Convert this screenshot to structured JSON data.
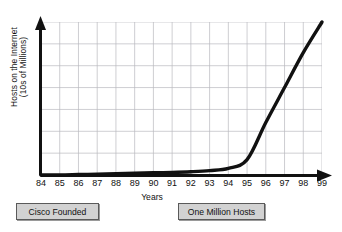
{
  "chart_data": {
    "type": "line",
    "title": "",
    "xlabel": "Years",
    "ylabel_lines": [
      "Hosts on the Internet",
      "(10s of Millions)"
    ],
    "ylabel": "Hosts on the Internet (10s of Millions)",
    "categories": [
      "84",
      "85",
      "86",
      "87",
      "88",
      "89",
      "90",
      "91",
      "92",
      "93",
      "94",
      "95",
      "96",
      "97",
      "98",
      "99"
    ],
    "x": [
      84,
      85,
      86,
      87,
      88,
      89,
      90,
      91,
      92,
      93,
      94,
      95,
      96,
      97,
      98,
      99
    ],
    "values": [
      0.0,
      0.0,
      0.02,
      0.04,
      0.06,
      0.08,
      0.1,
      0.12,
      0.15,
      0.2,
      0.3,
      0.7,
      2.4,
      4.0,
      5.6,
      7.0
    ],
    "ylim": [
      0,
      7
    ],
    "xlim": [
      84,
      99
    ],
    "grid": true,
    "grid_columns": 15,
    "grid_rows": 7,
    "y_tick_labels": [],
    "legend": "none",
    "series": [
      {
        "name": "Hosts on the Internet",
        "color": "#111111",
        "values": [
          0.0,
          0.0,
          0.02,
          0.04,
          0.06,
          0.08,
          0.1,
          0.12,
          0.15,
          0.2,
          0.3,
          0.7,
          2.4,
          4.0,
          5.6,
          7.0
        ]
      }
    ],
    "annotations": [
      {
        "id": "cisco",
        "label": "Cisco Founded"
      },
      {
        "id": "hosts",
        "label": "One Million Hosts"
      }
    ],
    "axis_color": "#111111",
    "grid_color": "#b9b9bf",
    "curve_color": "#111111",
    "background": "#ffffff",
    "annotation_fill": "#d2d2d2",
    "annotation_border": "#5a5a5a"
  }
}
